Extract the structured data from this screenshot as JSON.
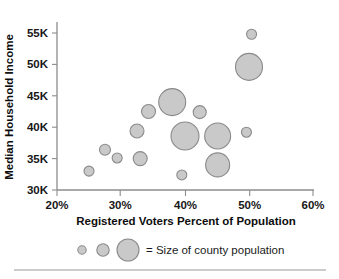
{
  "chart_data": {
    "type": "scatter",
    "title": "",
    "xlabel": "Registered Voters Percent of Population",
    "ylabel": "Median Household Income",
    "xlim": [
      20,
      60
    ],
    "ylim": [
      30,
      55
    ],
    "grid": false,
    "legend_position": "bottom",
    "x_tick_labels": [
      "20%",
      "30%",
      "40%",
      "50%",
      "60%"
    ],
    "x_tick_values": [
      20,
      30,
      40,
      50,
      60
    ],
    "y_tick_labels": [
      "30K",
      "35K",
      "40K",
      "45K",
      "50K",
      "55K"
    ],
    "y_tick_values": [
      30,
      35,
      40,
      45,
      50,
      55
    ],
    "size_encoding": "Size of county population",
    "points": [
      {
        "x": 25.0,
        "y": 33.0,
        "r": 5.0
      },
      {
        "x": 27.5,
        "y": 36.4,
        "r": 5.5
      },
      {
        "x": 29.4,
        "y": 35.1,
        "r": 5.0
      },
      {
        "x": 32.5,
        "y": 39.4,
        "r": 7.0
      },
      {
        "x": 33.0,
        "y": 35.0,
        "r": 7.0
      },
      {
        "x": 34.3,
        "y": 42.5,
        "r": 7.0
      },
      {
        "x": 38.0,
        "y": 44.0,
        "r": 13.5
      },
      {
        "x": 39.5,
        "y": 32.4,
        "r": 5.0
      },
      {
        "x": 40.0,
        "y": 38.6,
        "r": 14.0
      },
      {
        "x": 42.3,
        "y": 42.4,
        "r": 6.5
      },
      {
        "x": 45.1,
        "y": 38.6,
        "r": 13.0
      },
      {
        "x": 45.1,
        "y": 34.0,
        "r": 12.0
      },
      {
        "x": 49.6,
        "y": 39.2,
        "r": 5.0
      },
      {
        "x": 50.0,
        "y": 49.6,
        "r": 13.5
      },
      {
        "x": 50.4,
        "y": 54.8,
        "r": 5.0
      }
    ]
  },
  "legend": {
    "bubbles": [
      {
        "r": 4.2
      },
      {
        "r": 6.2
      },
      {
        "r": 11.0
      }
    ],
    "label": "= Size of county population"
  },
  "colors": {
    "bubble_fill": "#c9c9c9",
    "bubble_stroke": "#8a8a8a",
    "axis": "#8c8c8c",
    "text": "#1a1a1a"
  }
}
